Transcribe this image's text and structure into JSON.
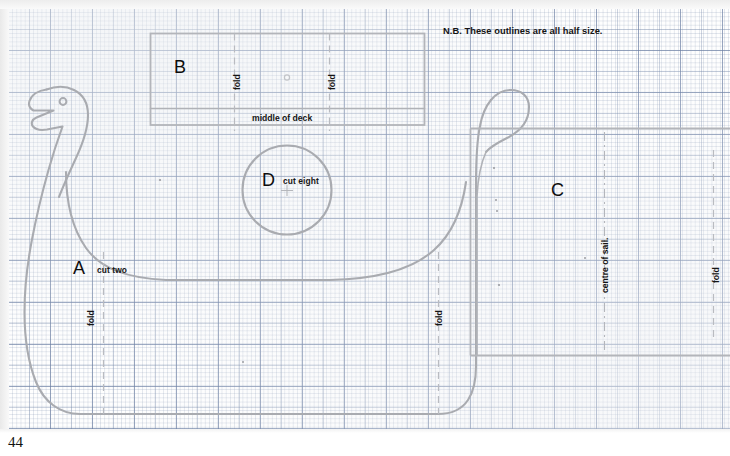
{
  "page": {
    "number": "44",
    "note": "N.B. These outlines are all half size."
  },
  "pieces": [
    {
      "id": "A",
      "letter": "A",
      "cut": "cut two",
      "name": "hull-side"
    },
    {
      "id": "B",
      "letter": "B",
      "cut": "",
      "name": "deck"
    },
    {
      "id": "C",
      "letter": "C",
      "cut": "",
      "name": "sail"
    },
    {
      "id": "D",
      "letter": "D",
      "cut": "cut eight",
      "name": "shield"
    }
  ],
  "annotations": {
    "middle_of_deck": "middle of deck",
    "centre_of_sail": "centre of sail.",
    "fold": "fold",
    "fold_labels": [
      {
        "key": "deck-left",
        "text": "fold"
      },
      {
        "key": "deck-right",
        "text": "fold"
      },
      {
        "key": "hull-left",
        "text": "fold"
      },
      {
        "key": "hull-right",
        "text": "fold"
      },
      {
        "key": "sail-right",
        "text": "fold"
      }
    ]
  },
  "colors": {
    "outline": "#a9abb0",
    "grid_minor": "#c9d1dd",
    "grid_major": "#9fb0c8",
    "text": "#101010",
    "paper": "#fdfdfd"
  }
}
